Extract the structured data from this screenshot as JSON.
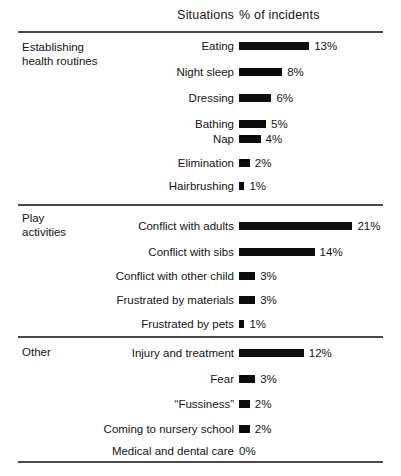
{
  "header": {
    "situations_label": "Situations",
    "percent_label": "% of incidents"
  },
  "groups": [
    {
      "name": "Establishing\nhealth routines",
      "rows": [
        {
          "label": "Eating",
          "value_label": "13%",
          "value": 13
        },
        {
          "label": "Night sleep",
          "value_label": "8%",
          "value": 8
        },
        {
          "label": "Dressing",
          "value_label": "6%",
          "value": 6
        },
        {
          "label": "Bathing",
          "value_label": "5%",
          "value": 5
        },
        {
          "label": "Nap",
          "value_label": "4%",
          "value": 4
        },
        {
          "label": "Elimination",
          "value_label": "2%",
          "value": 2
        },
        {
          "label": "Hairbrushing",
          "value_label": "1%",
          "value": 1
        }
      ]
    },
    {
      "name": "Play\nactivities",
      "rows": [
        {
          "label": "Conflict with adults",
          "value_label": "21%",
          "value": 21
        },
        {
          "label": "Conflict with sibs",
          "value_label": "14%",
          "value": 14
        },
        {
          "label": "Conflict with other child",
          "value_label": "3%",
          "value": 3
        },
        {
          "label": "Frustrated by materials",
          "value_label": "3%",
          "value": 3
        },
        {
          "label": "Frustrated by pets",
          "value_label": "1%",
          "value": 1
        }
      ]
    },
    {
      "name": "Other",
      "rows": [
        {
          "label": "Injury and treatment",
          "value_label": "12%",
          "value": 12
        },
        {
          "label": "Fear",
          "value_label": "3%",
          "value": 3
        },
        {
          "label": "“Fussiness”",
          "value_label": "2%",
          "value": 2
        },
        {
          "label": "Coming to nursery school",
          "value_label": "2%",
          "value": 2
        },
        {
          "label": "Medical and dental care",
          "value_label": "0%",
          "value": 0
        }
      ]
    }
  ],
  "chart_data": {
    "type": "bar",
    "orientation": "horizontal",
    "title": "",
    "xlabel": "% of incidents",
    "ylabel": "Situations",
    "xlim": [
      0,
      21
    ],
    "grid": false,
    "legend": null,
    "bar_color": "#0d0d0d",
    "categories": [
      "Eating",
      "Night sleep",
      "Dressing",
      "Bathing",
      "Nap",
      "Elimination",
      "Hairbrushing",
      "Conflict with adults",
      "Conflict with sibs",
      "Conflict with other child",
      "Frustrated by materials",
      "Frustrated by pets",
      "Injury and treatment",
      "Fear",
      "“Fussiness”",
      "Coming to nursery school",
      "Medical and dental care"
    ],
    "values": [
      13,
      8,
      6,
      5,
      4,
      2,
      1,
      21,
      14,
      3,
      3,
      1,
      12,
      3,
      2,
      2,
      0
    ],
    "data_labels": [
      "13%",
      "8%",
      "6%",
      "5%",
      "4%",
      "2%",
      "1%",
      "21%",
      "14%",
      "3%",
      "3%",
      "1%",
      "12%",
      "3%",
      "2%",
      "2%",
      "0%"
    ],
    "group_names": [
      "Establishing health routines",
      "Play activities",
      "Other"
    ],
    "group_sizes": [
      7,
      5,
      5
    ]
  },
  "layout": {
    "px_per_percent": 5.4,
    "min_bar_px": 5,
    "bar_left_px": 239,
    "rule_y": [
      31,
      204,
      336,
      461
    ],
    "group_label_y": [
      41,
      212,
      346
    ],
    "row_y": [
      [
        38,
        64,
        90,
        116,
        131,
        155,
        178
      ],
      [
        218,
        244,
        268,
        292,
        316
      ],
      [
        345,
        371,
        396,
        421,
        443
      ]
    ]
  }
}
